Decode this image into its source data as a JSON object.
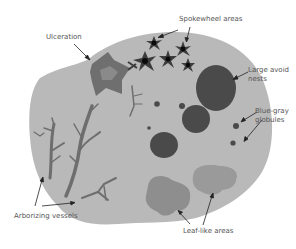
{
  "diagram": {
    "colors": {
      "background": "#ffffff",
      "lesion": "#b9b9b9",
      "ulceration_outer": "#6f6f6f",
      "ulceration_inner": "#8a8a8a",
      "vessels": "#6e6e6e",
      "spokewheel_arms": "#3c3c3c",
      "spokewheel_center": "#0a0a0a",
      "nests": "#4a4a4a",
      "leaf_areas": "#8e8e8e",
      "leaf_areas_light": "#9a9a9a",
      "label_text": "#555555",
      "arrow": "#222222"
    },
    "labels": {
      "ulceration": "Ulceration",
      "spokewheel": "Spokewheel areas",
      "large_nests_line1": "Large avoid",
      "large_nests_line2": "nests",
      "globules_line1": "Blue-gray",
      "globules_line2": "globules",
      "arborizing": "Arborizing vessels",
      "leaf_like": "Leaf-like areas"
    }
  }
}
